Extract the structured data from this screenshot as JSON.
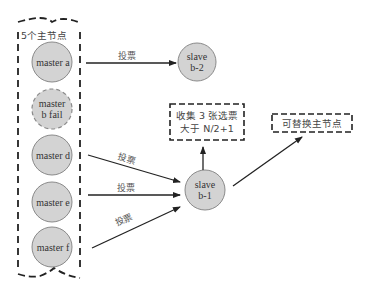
{
  "group": {
    "title": "5个主节点"
  },
  "masters": [
    {
      "label": "master a",
      "failed": false
    },
    {
      "label": "master\nb fail",
      "line1": "master",
      "line2": "b fail",
      "failed": true
    },
    {
      "label": "master d",
      "failed": false
    },
    {
      "label": "master e",
      "failed": false
    },
    {
      "label": "master f",
      "failed": false
    }
  ],
  "slaves": {
    "b2": {
      "line1": "slave",
      "line2": "b-2"
    },
    "b1": {
      "line1": "slave",
      "line2": "b-1"
    }
  },
  "edges": {
    "a_to_b2": "投票",
    "d_to_b1": "投票",
    "e_to_b1": "投票",
    "f_to_b1": "投票"
  },
  "boxes": {
    "collect": {
      "line1": "收集 3 张选票",
      "line2": "大于 N/2+1"
    },
    "replace": {
      "text": "可替换主节点"
    }
  },
  "colors": {
    "node_fill": "#d3d3d3",
    "node_stroke": "#8a8a8a",
    "line": "#222222"
  }
}
